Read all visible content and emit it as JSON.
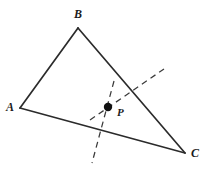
{
  "figure": {
    "kind": "geometry-diagram",
    "background_color": "#ffffff",
    "stroke_color": "#2b2b2b",
    "dash_color": "#3a3a3a",
    "point_color": "#111111",
    "labels": {
      "A": "A",
      "B": "B",
      "C": "C",
      "P": "P"
    },
    "vertices": {
      "A": {
        "x": 20,
        "y": 108
      },
      "B": {
        "x": 78,
        "y": 28
      },
      "C": {
        "x": 185,
        "y": 153
      }
    },
    "interior_point": {
      "name": "P",
      "x": 108,
      "y": 107,
      "radius": 4.2
    },
    "edges": [
      {
        "name": "AB",
        "from": "A",
        "to": "B"
      },
      {
        "name": "BC",
        "from": "B",
        "to": "C"
      },
      {
        "name": "AC",
        "from": "A",
        "to": "C"
      }
    ],
    "dashed_lines": [
      {
        "name": "steep-dashed-line",
        "x1": 114,
        "y1": 81,
        "x2": 92,
        "y2": 163
      },
      {
        "name": "diagonal-dashed-line",
        "x1": 90,
        "y1": 120,
        "x2": 164,
        "y2": 69
      }
    ]
  }
}
